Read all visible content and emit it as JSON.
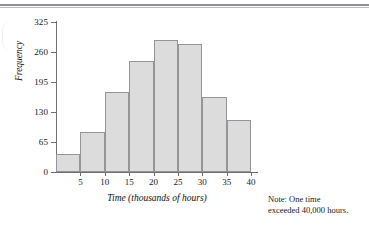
{
  "top_rule": {
    "present": true
  },
  "note": {
    "line1": "Note:  One time",
    "line2": "exceeded 40,000 hours."
  },
  "colors": {
    "bar_fill": "#dcdcdc",
    "bar_stroke": "#949598",
    "axis": "#6e6f72",
    "rule": "#8f9093",
    "text": "#1a1a1a"
  },
  "chart_data": {
    "type": "bar",
    "title": "",
    "subtitle": "",
    "xlabel": "Time (thousands of hours)",
    "ylabel": "Frequency",
    "categories": [
      "0-5",
      "5-10",
      "10-15",
      "15-20",
      "20-25",
      "25-30",
      "30-35",
      "35-40"
    ],
    "bin_edges": [
      0,
      5,
      10,
      15,
      20,
      25,
      30,
      35,
      40
    ],
    "values": [
      39,
      87,
      174,
      241,
      286,
      277,
      163,
      113
    ],
    "xlim": [
      0,
      40
    ],
    "ylim": [
      0,
      325
    ],
    "xticks": [
      5,
      10,
      15,
      20,
      25,
      30,
      35,
      40
    ],
    "xtick_labels": [
      "5",
      "10",
      "15",
      "20",
      "25",
      "30",
      "35",
      "40"
    ],
    "yticks": [
      0,
      65,
      130,
      195,
      260,
      325
    ],
    "ytick_labels": [
      "0",
      "65",
      "130",
      "195",
      "260",
      "325"
    ],
    "grid": false,
    "legend": null,
    "annotations": [
      "Note:  One time exceeded 40,000 hours."
    ]
  }
}
